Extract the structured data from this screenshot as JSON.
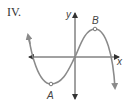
{
  "figure": {
    "label": "IV.",
    "type": "cubic function graph"
  },
  "axes": {
    "x_label": "x",
    "y_label": "y"
  },
  "points": [
    {
      "name": "A",
      "description": "local minimum"
    },
    {
      "name": "B",
      "description": "local maximum"
    }
  ],
  "colors": {
    "curve": "#8a8a8a",
    "axes": "#444444",
    "text": "#333333"
  }
}
